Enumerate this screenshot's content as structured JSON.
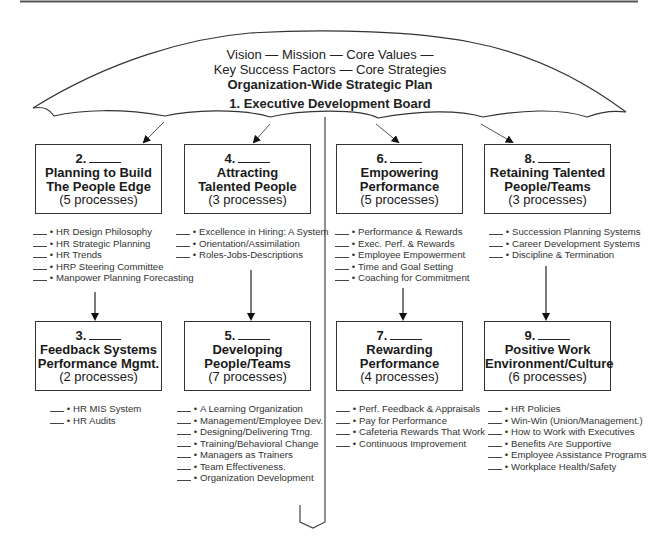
{
  "umbrella": {
    "line1": "Vision — Mission — Core Values —",
    "line2": "Key Success Factors — Core Strategies",
    "line3": "Organization-Wide Strategic Plan",
    "line4": "1. Executive Development Board"
  },
  "boxes": [
    {
      "num": "2.",
      "title1": "Planning to Build",
      "title2": "The People Edge",
      "count": "(5 processes)",
      "items": [
        "HR Design Philosophy",
        "HR Strategic Planning",
        "HR Trends",
        "HRP Steering Committee",
        "Manpower Planning Forecasting"
      ]
    },
    {
      "num": "3.",
      "title1": "Feedback Systems",
      "title2": "Performance Mgmt.",
      "count": "(2 processes)",
      "items": [
        "HR MIS System",
        "HR Audits"
      ]
    },
    {
      "num": "4.",
      "title1": "Attracting",
      "title2": "Talented People",
      "count": "(3 processes)",
      "items": [
        "Excellence in Hiring: A System",
        "Orientation/Assimilation",
        "Roles-Jobs-Descriptions"
      ]
    },
    {
      "num": "5.",
      "title1": "Developing",
      "title2": "People/Teams",
      "count": "(7 processes)",
      "items": [
        "A Learning Organization",
        "Management/Employee Dev.",
        "Designing/Delivering Trng.",
        "Training/Behavioral Change",
        "Managers as Trainers",
        "Team Effectiveness.",
        "Organization Development"
      ]
    },
    {
      "num": "6.",
      "title1": "Empowering",
      "title2": "Performance",
      "count": "(5 processes)",
      "items": [
        "Performance & Rewards",
        "Exec. Perf. & Rewards",
        "Employee Empowerment",
        "Time and Goal Setting",
        "Coaching for Commitment"
      ]
    },
    {
      "num": "7.",
      "title1": "Rewarding",
      "title2": "Performance",
      "count": "(4 processes)",
      "items": [
        "Perf. Feedback & Appraisals",
        "Pay for Performance",
        "Cafeteria Rewards That Work",
        "Continuous Improvement"
      ]
    },
    {
      "num": "8.",
      "title1": "Retaining Talented",
      "title2": "People/Teams",
      "count": "(3 processes)",
      "items": [
        "Succession Planning Systems",
        "Career Development Systems",
        "Discipline & Termination"
      ]
    },
    {
      "num": "9.",
      "title1": "Positive Work",
      "title2": "Environment/Culture",
      "count": "(6 processes)",
      "items": [
        "HR Policies",
        "Win-Win (Union/Management.)",
        "How to Work with Executives",
        "Benefits Are Supportive",
        "Employee Assistance Programs",
        "Workplace Health/Safety"
      ]
    }
  ],
  "bullet": "•"
}
